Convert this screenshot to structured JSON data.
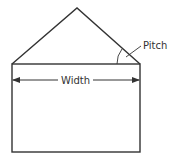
{
  "diagram": {
    "labels": {
      "width": "Width",
      "pitch": "Pitch"
    },
    "colors": {
      "stroke": "#333333",
      "background": "#ffffff"
    },
    "shapes": {
      "roof": "triangle",
      "wall": "rectangle",
      "width_dimension": "double-headed arrow",
      "pitch_marker": "angle arc with leader line"
    }
  }
}
